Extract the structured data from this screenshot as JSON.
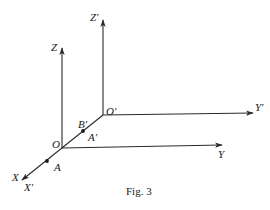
{
  "figure": {
    "caption": "Fig. 3",
    "line_color": "#2a2a2a",
    "background": "#ffffff"
  },
  "labels": {
    "Z": "Z",
    "Z_prime": "Z′",
    "O": "O",
    "O_prime": "O′",
    "Y": "Y",
    "Y_prime": "Y′",
    "X": "X",
    "X_prime": "X′",
    "A": "A",
    "A_prime": "A′",
    "B_prime": "B′"
  },
  "geometry": {
    "O": [
      62,
      148
    ],
    "O_prime": [
      103,
      115
    ],
    "Z_tip": [
      62,
      48
    ],
    "Z_prime_tip": [
      103,
      20
    ],
    "Y_tip": [
      222,
      145
    ],
    "Y_prime_tip": [
      253,
      113
    ],
    "X_tip": [
      22,
      180
    ],
    "A": [
      47,
      161
    ],
    "A_prime": [
      83,
      131
    ]
  }
}
